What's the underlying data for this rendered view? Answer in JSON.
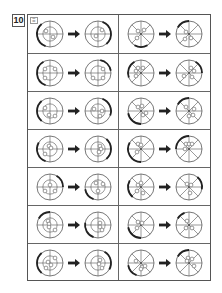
{
  "question": {
    "number": "10",
    "badge": "☰"
  },
  "grid": {
    "rows": 7,
    "columns": 2,
    "left_type": "crosshair",
    "right_type": "wheel",
    "cells": [
      [
        {
          "before": {
            "dots": [
              [
                -4,
                -3
              ],
              [
                3,
                3
              ]
            ],
            "arc": [
              200,
              320
            ]
          },
          "after": {
            "dots": [
              [
                4,
                -4
              ],
              [
                -2,
                2
              ]
            ],
            "arc": [
              20,
              140
            ]
          }
        },
        {
          "before": {
            "dots": [
              [
                -3,
                -3
              ],
              [
                3,
                -4
              ],
              [
                -4,
                4
              ]
            ],
            "arc": [
              150,
              210
            ]
          },
          "after": {
            "dots": [
              [
                -3,
                -2
              ],
              [
                2,
                4
              ],
              [
                -4,
                5
              ]
            ],
            "arc": [
              300,
              360
            ]
          }
        }
      ],
      [
        {
          "before": {
            "dots": [
              [
                -5,
                -4
              ],
              [
                5,
                -4
              ],
              [
                -5,
                5
              ]
            ],
            "arc": [
              200,
              330
            ]
          },
          "after": {
            "dots": [
              [
                5,
                -4
              ],
              [
                5,
                5
              ],
              [
                -5,
                5
              ]
            ],
            "arc": [
              10,
              80
            ]
          }
        },
        {
          "before": {
            "dots": [
              [
                -5,
                -2
              ],
              [
                -3,
                -5
              ],
              [
                2,
                -5
              ],
              [
                -5,
                3
              ]
            ],
            "arc": [
              250,
              330
            ]
          },
          "after": {
            "dots": [
              [
                2,
                -5
              ],
              [
                5,
                -2
              ],
              [
                -5,
                3
              ],
              [
                3,
                4
              ]
            ],
            "arc": [
              30,
              90
            ]
          }
        }
      ],
      [
        {
          "before": {
            "dots": [
              [
                -5,
                -3
              ],
              [
                -1,
                4
              ],
              [
                5,
                5
              ]
            ],
            "arc": [
              220,
              320
            ]
          },
          "after": {
            "dots": [
              [
                -4,
                -2
              ],
              [
                4,
                0
              ],
              [
                2,
                5
              ]
            ],
            "arc": [
              20,
              110
            ]
          }
        },
        {
          "before": {
            "dots": [
              [
                -3,
                -4
              ],
              [
                1,
                -5
              ],
              [
                2,
                4
              ],
              [
                5,
                2
              ]
            ],
            "arc": [
              180,
              260
            ]
          },
          "after": {
            "dots": [
              [
                -3,
                -4
              ],
              [
                5,
                -2
              ],
              [
                0,
                5
              ],
              [
                4,
                4
              ]
            ],
            "arc": [
              300,
              360
            ]
          }
        }
      ],
      [
        {
          "before": {
            "dots": [
              [
                -1,
                -3
              ],
              [
                1,
                -1
              ],
              [
                -5,
                5
              ]
            ],
            "arc": [
              200,
              300
            ]
          },
          "after": {
            "dots": [
              [
                2,
                -3
              ],
              [
                3,
                0
              ],
              [
                1,
                3
              ]
            ],
            "arc": [
              40,
              140
            ]
          }
        },
        {
          "before": {
            "dots": [
              [
                -3,
                -5
              ],
              [
                0,
                -4
              ],
              [
                -4,
                3
              ]
            ],
            "arc": [
              180,
              300
            ]
          },
          "after": {
            "dots": [
              [
                -3,
                -5
              ],
              [
                0,
                -5
              ],
              [
                3,
                -5
              ],
              [
                -4,
                0
              ]
            ],
            "arc": [
              270,
              360
            ]
          }
        }
      ],
      [
        {
          "before": {
            "dots": [
              [
                -5,
                4
              ],
              [
                0,
                -2
              ],
              [
                5,
                4
              ]
            ],
            "arc": [
              30,
              90
            ]
          },
          "after": {
            "dots": [
              [
                -2,
                -4
              ],
              [
                5,
                -3
              ],
              [
                0,
                4
              ]
            ],
            "arc": [
              200,
              260
            ]
          }
        },
        {
          "before": {
            "dots": [
              [
                -3,
                -2
              ],
              [
                0,
                -4
              ],
              [
                -4,
                4
              ],
              [
                2,
                6
              ]
            ],
            "arc": [
              220,
              300
            ]
          },
          "after": {
            "dots": [
              [
                -2,
                -3
              ],
              [
                2,
                -2
              ],
              [
                1,
                6
              ]
            ],
            "arc": [
              40,
              100
            ]
          }
        }
      ],
      [
        {
          "before": {
            "dots": [
              [
                -2,
                -4
              ],
              [
                -1,
                -1
              ],
              [
                -1,
                2
              ],
              [
                5,
                5
              ]
            ],
            "arc": [
              300,
              360
            ]
          },
          "after": {
            "dots": [
              [
                2,
                -2
              ],
              [
                2,
                2
              ],
              [
                4,
                5
              ]
            ],
            "arc": [
              200,
              280
            ]
          }
        },
        {
          "before": {
            "dots": [
              [
                -3,
                -3
              ],
              [
                1,
                -2
              ],
              [
                -4,
                3
              ]
            ],
            "arc": [
              180,
              260
            ]
          },
          "after": {
            "dots": [
              [
                -2,
                -4
              ],
              [
                3,
                3
              ],
              [
                -3,
                3
              ]
            ],
            "arc": [
              300,
              340
            ]
          }
        }
      ],
      [
        {
          "before": {
            "dots": [
              [
                5,
                -5
              ],
              [
                -2,
                -1
              ],
              [
                1,
                2
              ],
              [
                -4,
                5
              ]
            ],
            "arc": [
              220,
              320
            ]
          },
          "after": {
            "dots": [
              [
                2,
                -3
              ],
              [
                1,
                1
              ],
              [
                4,
                5
              ]
            ],
            "arc": [
              30,
              120
            ]
          }
        },
        {
          "before": {
            "dots": [
              [
                -5,
                -2
              ],
              [
                1,
                4
              ],
              [
                4,
                3
              ],
              [
                0,
                6
              ]
            ],
            "arc": [
              200,
              260
            ]
          },
          "after": {
            "dots": [
              [
                -1,
                -5
              ],
              [
                3,
                -4
              ],
              [
                -2,
                -2
              ],
              [
                5,
                3
              ]
            ],
            "arc": [
              300,
              360
            ]
          }
        }
      ]
    ]
  },
  "colors": {
    "line": "#555555",
    "arrow": "#222222",
    "background": "#ffffff"
  }
}
